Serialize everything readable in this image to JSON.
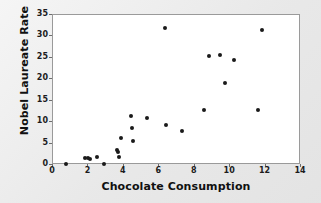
{
  "chart_data": {
    "type": "scatter",
    "title": "",
    "xlabel": "Chocolate Consumption",
    "ylabel": "Nobel Laureate Rate",
    "xlim": [
      0,
      14
    ],
    "ylim": [
      0,
      35
    ],
    "xticks": [
      0,
      2,
      4,
      6,
      8,
      10,
      12,
      14
    ],
    "yticks": [
      0,
      5,
      10,
      15,
      20,
      25,
      30,
      35
    ],
    "xtick_labels": [
      "0",
      "2",
      "4",
      "6",
      "8",
      "10",
      "12",
      "14"
    ],
    "ytick_labels": [
      "0",
      "5",
      "10",
      "15",
      "20",
      "25",
      "30",
      "35"
    ],
    "grid": false,
    "legend": false,
    "marker": "filled-circle",
    "marker_color": "#1a1a1a",
    "plot_background": "#ffffff",
    "figure_background": "#e9e9e9",
    "points": [
      {
        "x": 0.75,
        "y": 0.2
      },
      {
        "x": 1.8,
        "y": 1.6
      },
      {
        "x": 1.95,
        "y": 1.7
      },
      {
        "x": 2.1,
        "y": 1.5
      },
      {
        "x": 2.5,
        "y": 1.9
      },
      {
        "x": 2.9,
        "y": 0.2
      },
      {
        "x": 3.6,
        "y": 3.4
      },
      {
        "x": 3.65,
        "y": 3.1
      },
      {
        "x": 3.7,
        "y": 1.8
      },
      {
        "x": 3.85,
        "y": 6.2
      },
      {
        "x": 4.4,
        "y": 11.5
      },
      {
        "x": 4.45,
        "y": 8.7
      },
      {
        "x": 4.5,
        "y": 5.6
      },
      {
        "x": 5.3,
        "y": 10.9
      },
      {
        "x": 6.3,
        "y": 32.0
      },
      {
        "x": 6.4,
        "y": 9.3
      },
      {
        "x": 7.3,
        "y": 7.9
      },
      {
        "x": 8.5,
        "y": 12.9
      },
      {
        "x": 8.8,
        "y": 25.5
      },
      {
        "x": 9.4,
        "y": 25.7
      },
      {
        "x": 9.7,
        "y": 19.1
      },
      {
        "x": 10.2,
        "y": 24.6
      },
      {
        "x": 11.6,
        "y": 12.9
      },
      {
        "x": 11.8,
        "y": 31.6
      }
    ]
  }
}
